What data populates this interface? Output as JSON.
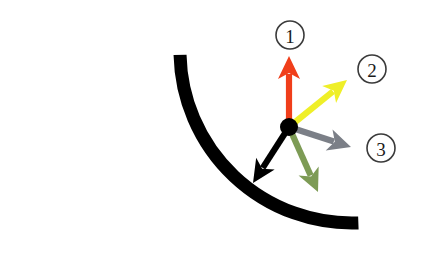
{
  "figure": {
    "background_color": "#ffffff",
    "width": 424,
    "height": 261
  },
  "track": {
    "name": "curved-track-arc",
    "color": "#000000",
    "stroke_width": 13,
    "description": "Thick black circular arc, concave up-right, quarter circle",
    "start_point": [
      35,
      58
    ],
    "end_point": [
      357,
      186
    ],
    "center": [
      352,
      51
    ],
    "radius": 172
  },
  "origin": {
    "name": "object-point",
    "color": "#000000",
    "x": 289,
    "y": 127,
    "radius": 9
  },
  "vectors": [
    {
      "id": "red-vector",
      "color": "#F03E1A",
      "direction": "up",
      "angle_deg": 90,
      "tip": [
        289,
        56
      ],
      "length": 71,
      "label": "1"
    },
    {
      "id": "yellow-vector",
      "color": "#EFEF28",
      "direction": "up-right",
      "angle_deg": 38,
      "tip": [
        347,
        80
      ],
      "length": 74,
      "label": "2"
    },
    {
      "id": "gray-vector",
      "color": "#7B7F87",
      "direction": "right-down",
      "angle_deg": -17,
      "tip": [
        351,
        147
      ],
      "length": 65,
      "label": "3"
    },
    {
      "id": "green-vector",
      "color": "#7D9B55",
      "direction": "down-right",
      "angle_deg": -61,
      "tip": [
        318,
        192
      ],
      "length": 74,
      "label": ""
    },
    {
      "id": "black-vector",
      "color": "#000000",
      "direction": "down-left",
      "angle_deg": -120,
      "tip": [
        253,
        183
      ],
      "length": 68,
      "label": ""
    }
  ],
  "labels": [
    {
      "id": "label-1",
      "text": "1",
      "x": 290,
      "y": 35,
      "radius": 14
    },
    {
      "id": "label-2",
      "text": "2",
      "x": 372,
      "y": 69,
      "radius": 14
    },
    {
      "id": "label-3",
      "text": "3",
      "x": 381,
      "y": 148,
      "radius": 14
    }
  ],
  "colors": {
    "red": "#F03E1A",
    "yellow": "#EFEF28",
    "gray": "#7B7F87",
    "green": "#7D9B55",
    "black": "#000000",
    "label_stroke": "#3a3a3a"
  }
}
